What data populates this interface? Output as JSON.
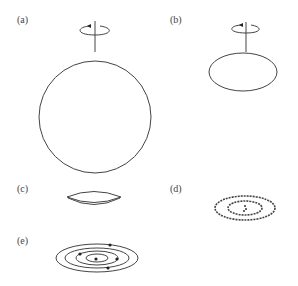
{
  "panels": [
    {
      "id": "a",
      "label": "(a)",
      "description": "Spherical cloud with rotation axis"
    },
    {
      "id": "b",
      "label": "(b)",
      "description": "Flattened ellipsoidal cloud with rotation axis"
    },
    {
      "id": "c",
      "label": "(c)",
      "description": "Thin lens-shaped disk"
    },
    {
      "id": "d",
      "label": "(d)",
      "description": "Dusty rings (dashed) around central condensation"
    },
    {
      "id": "e",
      "label": "(e)",
      "description": "Concentric elliptical orbits with planets (dots)"
    }
  ],
  "colors": {
    "stroke": "#444444",
    "background": "#ffffff",
    "text": "#444444"
  }
}
